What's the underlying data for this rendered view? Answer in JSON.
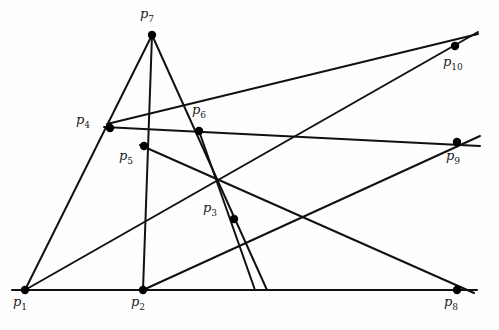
{
  "figure": {
    "type": "point-line-incidence-diagram",
    "title": "",
    "background_color": "#fefefe",
    "line_color": "#111111",
    "point_color": "#000000",
    "label_color": "#1a1a1a",
    "width": 499,
    "height": 330,
    "point_radius": 4.2,
    "line_width": 2.0
  },
  "points": [
    {
      "id": "p1",
      "label": "p",
      "sub": "1",
      "x": 25,
      "y": 290,
      "label_x": 13,
      "label_y": 294
    },
    {
      "id": "p2",
      "label": "p",
      "sub": "2",
      "x": 143,
      "y": 290,
      "label_x": 131,
      "label_y": 294
    },
    {
      "id": "p3",
      "label": "p",
      "sub": "3",
      "x": 234,
      "y": 219,
      "label_x": 203,
      "label_y": 200
    },
    {
      "id": "p4",
      "label": "p",
      "sub": "4",
      "x": 110,
      "y": 128,
      "label_x": 76,
      "label_y": 112
    },
    {
      "id": "p5",
      "label": "p",
      "sub": "5",
      "x": 144,
      "y": 146,
      "label_x": 119,
      "label_y": 148
    },
    {
      "id": "p6",
      "label": "p",
      "sub": "6",
      "x": 199,
      "y": 131,
      "label_x": 192,
      "label_y": 102
    },
    {
      "id": "p7",
      "label": "p",
      "sub": "7",
      "x": 152,
      "y": 35,
      "label_x": 140,
      "label_y": 6
    },
    {
      "id": "p8",
      "label": "p",
      "sub": "8",
      "x": 457,
      "y": 290,
      "label_x": 444,
      "label_y": 294
    },
    {
      "id": "p9",
      "label": "p",
      "sub": "9",
      "x": 457,
      "y": 142,
      "label_x": 446,
      "label_y": 148
    },
    {
      "id": "p10",
      "label": "p",
      "sub": "10",
      "x": 455,
      "y": 46,
      "label_x": 443,
      "label_y": 54
    }
  ],
  "lines": [
    {
      "name": "baseline-p1-p8",
      "from": "p1",
      "to": "p8",
      "x1": 12,
      "y1": 290,
      "x2": 477,
      "y2": 290
    },
    {
      "name": "line-p1-p4-p7",
      "from": "p1",
      "to": "p7",
      "x1": 25,
      "y1": 290,
      "x2": 152,
      "y2": 35
    },
    {
      "name": "line-p7-p2",
      "from": "p7",
      "to": "p2",
      "x1": 152,
      "y1": 35,
      "x2": 143,
      "y2": 290
    },
    {
      "name": "line-p7-p6-baseline",
      "from": "p7",
      "to": "p6",
      "x1": 152,
      "y1": 35,
      "x2": 267,
      "y2": 290
    },
    {
      "name": "line-p4-p6-p9",
      "from": "p4",
      "to": "p9",
      "x1": 104,
      "y1": 127,
      "x2": 480,
      "y2": 146
    },
    {
      "name": "line-p4-p5-p3-p10",
      "from": "p4",
      "to": "p10",
      "x1": 107,
      "y1": 124,
      "x2": 478,
      "y2": 34
    },
    {
      "name": "line-p1-p3-p10",
      "from": "p1",
      "to": "p10",
      "x1": 25,
      "y1": 290,
      "x2": 478,
      "y2": 32
    },
    {
      "name": "line-p2-p3-p9",
      "from": "p2",
      "to": "p9",
      "x1": 143,
      "y1": 290,
      "x2": 480,
      "y2": 136
    },
    {
      "name": "line-p5-p6-p8",
      "from": "p5",
      "to": "p8",
      "x1": 140,
      "y1": 145,
      "x2": 474,
      "y2": 293
    },
    {
      "name": "line-p6-p3-baseline",
      "from": "p6",
      "to": "p3",
      "x1": 199,
      "y1": 131,
      "x2": 255,
      "y2": 290
    }
  ]
}
